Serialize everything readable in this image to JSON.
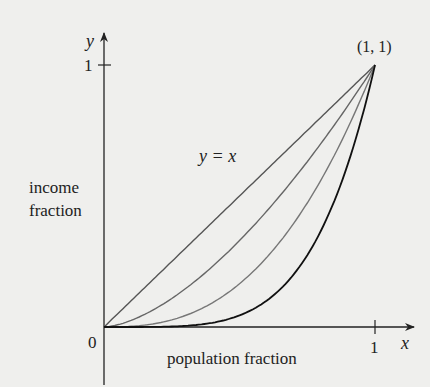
{
  "chart_data": {
    "type": "line",
    "title": "",
    "xlabel": "population fraction",
    "ylabel": "income fraction",
    "x_axis_symbol": "x",
    "y_axis_symbol": "y",
    "xlim": [
      0,
      1
    ],
    "ylim": [
      0,
      1
    ],
    "x_ticks": [
      "0",
      "1"
    ],
    "y_ticks": [
      "1"
    ],
    "origin_label": "0",
    "grid": false,
    "legend": false,
    "annotations": [
      {
        "text": "y = x",
        "x": 0.45,
        "y": 0.62
      },
      {
        "text": "(1, 1)",
        "x": 1,
        "y": 1
      }
    ],
    "series": [
      {
        "name": "y = x",
        "exponent": 1,
        "color": "#555555",
        "x": [
          0,
          0.25,
          0.5,
          0.75,
          1
        ],
        "values": [
          0,
          0.25,
          0.5,
          0.75,
          1
        ]
      },
      {
        "name": "curve 2",
        "exponent": 1.6,
        "color": "#666666",
        "x": [
          0,
          0.25,
          0.5,
          0.75,
          1
        ],
        "values": [
          0,
          0.11,
          0.33,
          0.63,
          1
        ]
      },
      {
        "name": "curve 3",
        "exponent": 2.6,
        "color": "#777777",
        "x": [
          0,
          0.25,
          0.5,
          0.75,
          1
        ],
        "values": [
          0,
          0.03,
          0.16,
          0.47,
          1
        ]
      },
      {
        "name": "curve 4",
        "exponent": 4.5,
        "color": "#111111",
        "x": [
          0,
          0.25,
          0.5,
          0.75,
          1
        ],
        "values": [
          0,
          0.002,
          0.04,
          0.27,
          1
        ]
      }
    ]
  },
  "labels": {
    "y_symbol": "y",
    "x_symbol": "x",
    "y_tick_1": "1",
    "x_tick_1": "1",
    "origin": "0",
    "point": "(1, 1)",
    "identity": "y = x",
    "ylabel_line1": "income",
    "ylabel_line2": "fraction",
    "xlabel": "population fraction"
  }
}
